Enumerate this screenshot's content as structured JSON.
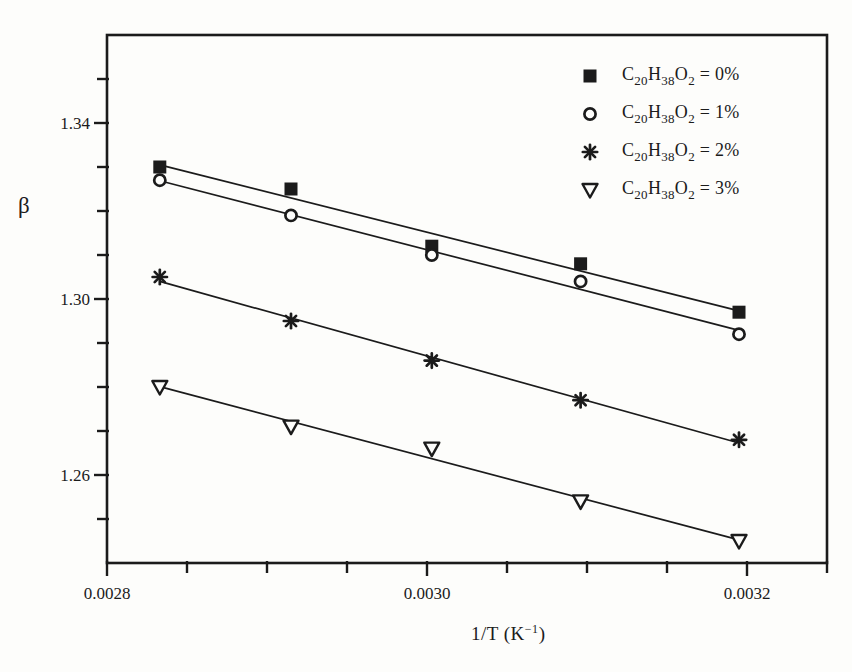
{
  "figure": {
    "background": "#fdfdfb",
    "ink": "#1b1b1b"
  },
  "y_axis": {
    "label": "β",
    "labeled_ticks": [
      "1.34",
      "1.30",
      "1.26"
    ]
  },
  "x_axis": {
    "label_plain": "1/T (K−1)",
    "label_parts": [
      {
        "text": "1/T (K"
      },
      {
        "text": "−1",
        "sup": true
      },
      {
        "text": ")"
      }
    ],
    "labeled_ticks": [
      "0.0028",
      "0.0030",
      "0.0032"
    ]
  },
  "chart_data": {
    "type": "scatter",
    "title": "",
    "xlabel": "1/T (K−1)",
    "ylabel": "β",
    "xlim": [
      0.0028,
      0.00325
    ],
    "ylim": [
      1.24,
      1.36
    ],
    "x_minor_tick_step": 5e-05,
    "y_minor_tick_step": 0.01,
    "x_major_ticks": [
      {
        "value": 0.0028,
        "label": "0.0028"
      },
      {
        "value": 0.003,
        "label": "0.0030"
      },
      {
        "value": 0.0032,
        "label": "0.0032"
      }
    ],
    "y_major_ticks": [
      {
        "value": 1.34,
        "label": "1.34"
      },
      {
        "value": 1.3,
        "label": "1.30"
      },
      {
        "value": 1.26,
        "label": "1.26"
      }
    ],
    "grid": false,
    "legend_position": "top-right-inside",
    "fit_lines": true,
    "x": [
      0.002833,
      0.002915,
      0.003003,
      0.003096,
      0.003195
    ],
    "series": [
      {
        "name": "C20H38O2 = 0%",
        "marker": "filled-square",
        "values": [
          1.33,
          1.325,
          1.312,
          1.308,
          1.297
        ],
        "label_parts": [
          {
            "text": "C"
          },
          {
            "text": "20",
            "sub": true
          },
          {
            "text": "H"
          },
          {
            "text": "38",
            "sub": true
          },
          {
            "text": "O"
          },
          {
            "text": "2",
            "sub": true
          },
          {
            "text": " = 0%"
          }
        ]
      },
      {
        "name": "C20H38O2 = 1%",
        "marker": "open-circle",
        "values": [
          1.327,
          1.319,
          1.31,
          1.304,
          1.292
        ],
        "label_parts": [
          {
            "text": "C"
          },
          {
            "text": "20",
            "sub": true
          },
          {
            "text": "H"
          },
          {
            "text": "38",
            "sub": true
          },
          {
            "text": "O"
          },
          {
            "text": "2",
            "sub": true
          },
          {
            "text": " = 1%"
          }
        ]
      },
      {
        "name": "C20H38O2 = 2%",
        "marker": "asterisk",
        "values": [
          1.305,
          1.295,
          1.286,
          1.277,
          1.268
        ],
        "label_parts": [
          {
            "text": "C"
          },
          {
            "text": "20",
            "sub": true
          },
          {
            "text": "H"
          },
          {
            "text": "38",
            "sub": true
          },
          {
            "text": "O"
          },
          {
            "text": "2",
            "sub": true
          },
          {
            "text": " = 2%"
          }
        ]
      },
      {
        "name": "C20H38O2 = 3%",
        "marker": "open-triangle-down",
        "values": [
          1.28,
          1.271,
          1.266,
          1.254,
          1.245
        ],
        "label_parts": [
          {
            "text": "C"
          },
          {
            "text": "20",
            "sub": true
          },
          {
            "text": "H"
          },
          {
            "text": "38",
            "sub": true
          },
          {
            "text": "O"
          },
          {
            "text": "2",
            "sub": true
          },
          {
            "text": " = 3%"
          }
        ]
      }
    ]
  }
}
